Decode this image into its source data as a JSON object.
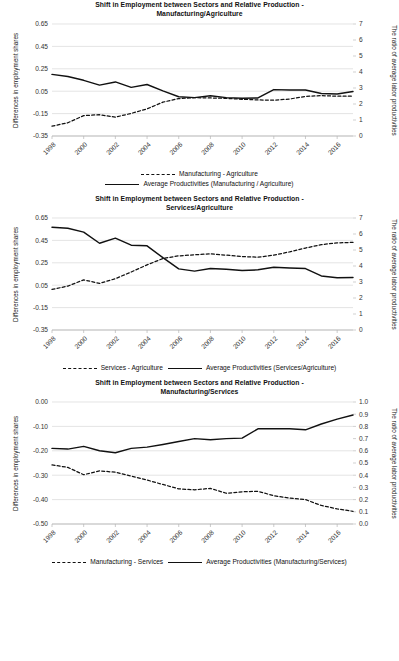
{
  "figure": {
    "axis_title_left": "Differences in employment shares",
    "axis_title_right": "The ratio of average labor productivities"
  },
  "chart_data": [
    {
      "type": "line",
      "title": "Shift in Employment between Sectors and Relative Production - Manufacturing/Agriculture",
      "title_line1": "Shift in Employment between Sectors and Relative Production -",
      "title_line2": "Manufacturing/Agriculture",
      "xlabel": "",
      "ylabel": "Differences in employment shares",
      "y2label": "The ratio of average labor productivities",
      "grid": true,
      "legend_position": "bottom",
      "legend_rows": 2,
      "x": [
        1998,
        1999,
        2000,
        2001,
        2002,
        2003,
        2004,
        2005,
        2006,
        2007,
        2008,
        2009,
        2010,
        2011,
        2012,
        2013,
        2014,
        2015,
        2016,
        2017
      ],
      "xticks": [
        1998,
        2000,
        2002,
        2004,
        2006,
        2008,
        2010,
        2012,
        2014,
        2016
      ],
      "ylim": [
        -0.35,
        0.65
      ],
      "yticks": [
        -0.35,
        -0.15,
        0.05,
        0.25,
        0.45,
        0.65
      ],
      "ytick_labels": [
        "-0.35",
        "-0.15",
        "0.05",
        "0.25",
        "0.45",
        "0.65"
      ],
      "y2lim": [
        0,
        7
      ],
      "y2ticks": [
        0,
        1,
        2,
        3,
        4,
        5,
        6,
        7
      ],
      "y2tick_labels": [
        "0",
        "1",
        "2",
        "3",
        "4",
        "5",
        "6",
        "7"
      ],
      "series": [
        {
          "name": "Manufacturing - Agriculture",
          "axis": "left",
          "style": "dashed",
          "values": [
            -0.262,
            -0.232,
            -0.168,
            -0.16,
            -0.182,
            -0.148,
            -0.108,
            -0.048,
            -0.016,
            -0.008,
            -0.01,
            -0.014,
            -0.022,
            -0.028,
            -0.03,
            -0.02,
            0.004,
            0.01,
            0.006,
            0.006
          ]
        },
        {
          "name": "Average Productivities (Manufacturing / Agriculture)",
          "axis": "right",
          "style": "solid",
          "values": [
            3.85,
            3.72,
            3.48,
            3.18,
            3.38,
            3.04,
            3.22,
            2.82,
            2.45,
            2.4,
            2.52,
            2.4,
            2.36,
            2.38,
            2.9,
            2.88,
            2.88,
            2.66,
            2.62,
            2.78
          ]
        }
      ]
    },
    {
      "type": "line",
      "title": "Shift in Employment between Sectors and Relative Production - Services/Agriculture",
      "title_line1": "Shift in Employment between Sectors and Relative Production -",
      "title_line2": "Services/Agriculture",
      "xlabel": "",
      "ylabel": "Differences in employment shares",
      "y2label": "The ratio of average labor productivities",
      "grid": true,
      "legend_position": "bottom",
      "legend_rows": 1,
      "x": [
        1998,
        1999,
        2000,
        2001,
        2002,
        2003,
        2004,
        2005,
        2006,
        2007,
        2008,
        2009,
        2010,
        2011,
        2012,
        2013,
        2014,
        2015,
        2016,
        2017
      ],
      "xticks": [
        1998,
        2000,
        2002,
        2004,
        2006,
        2008,
        2010,
        2012,
        2014,
        2016
      ],
      "ylim": [
        -0.35,
        0.65
      ],
      "yticks": [
        -0.35,
        -0.15,
        0.05,
        0.25,
        0.45,
        0.65
      ],
      "ytick_labels": [
        "-0.35",
        "-0.15",
        "0.05",
        "0.25",
        "0.45",
        "0.65"
      ],
      "y2lim": [
        0,
        7
      ],
      "y2ticks": [
        0,
        1,
        2,
        3,
        4,
        5,
        6,
        7
      ],
      "y2tick_labels": [
        "0",
        "1",
        "2",
        "3",
        "4",
        "5",
        "6",
        "7"
      ],
      "series": [
        {
          "name": "Services - Agriculture",
          "axis": "left",
          "style": "dashed",
          "values": [
            0.012,
            0.042,
            0.098,
            0.066,
            0.108,
            0.168,
            0.232,
            0.288,
            0.312,
            0.322,
            0.33,
            0.318,
            0.306,
            0.3,
            0.318,
            0.348,
            0.382,
            0.412,
            0.428,
            0.432
          ]
        },
        {
          "name": "Average Productivities (Services/Agriculture)",
          "axis": "right",
          "style": "solid",
          "values": [
            6.42,
            6.36,
            6.12,
            5.42,
            5.74,
            5.3,
            5.26,
            4.52,
            3.82,
            3.68,
            3.84,
            3.8,
            3.72,
            3.76,
            3.92,
            3.88,
            3.84,
            3.38,
            3.26,
            3.28
          ]
        }
      ]
    },
    {
      "type": "line",
      "title": "Shift in Employment between Sectors and Relative Production - Manufacturing/Services",
      "title_line1": "Shift in Employment between Sectors and Relative Production -",
      "title_line2": "Manufacturing/Services",
      "xlabel": "",
      "ylabel": "Differences in employment shares",
      "y2label": "The ratio of average labor productivities",
      "grid": true,
      "legend_position": "bottom",
      "legend_rows": 1,
      "x": [
        1998,
        1999,
        2000,
        2001,
        2002,
        2003,
        2004,
        2005,
        2006,
        2007,
        2008,
        2009,
        2010,
        2011,
        2012,
        2013,
        2014,
        2015,
        2016,
        2017
      ],
      "xticks": [
        1998,
        2000,
        2002,
        2004,
        2006,
        2008,
        2010,
        2012,
        2014,
        2016
      ],
      "ylim": [
        -0.5,
        0.0
      ],
      "yticks": [
        -0.5,
        -0.4,
        -0.3,
        -0.2,
        -0.1,
        0.0
      ],
      "ytick_labels": [
        "-0.50",
        "-0.40",
        "-0.30",
        "-0.20",
        "-0.10",
        "0.00"
      ],
      "y2lim": [
        0.0,
        1.0
      ],
      "y2ticks": [
        0.0,
        0.1,
        0.2,
        0.3,
        0.4,
        0.5,
        0.6,
        0.7,
        0.8,
        0.9,
        1.0
      ],
      "y2tick_labels": [
        "0.0",
        "0.1",
        "0.2",
        "0.3",
        "0.4",
        "0.5",
        "0.6",
        "0.7",
        "0.8",
        "0.9",
        "1.0"
      ],
      "series": [
        {
          "name": "Manufacturing - Services",
          "axis": "left",
          "style": "dashed",
          "values": [
            -0.258,
            -0.268,
            -0.298,
            -0.282,
            -0.288,
            -0.304,
            -0.32,
            -0.338,
            -0.356,
            -0.36,
            -0.354,
            -0.374,
            -0.368,
            -0.366,
            -0.384,
            -0.394,
            -0.4,
            -0.424,
            -0.438,
            -0.448
          ]
        },
        {
          "name": "Average Productivities (Manufacturing/Services)",
          "axis": "right",
          "style": "solid",
          "values": [
            0.62,
            0.614,
            0.636,
            0.6,
            0.584,
            0.62,
            0.63,
            0.652,
            0.676,
            0.7,
            0.69,
            0.7,
            0.704,
            0.78,
            0.78,
            0.78,
            0.772,
            0.82,
            0.86,
            0.894
          ]
        }
      ]
    }
  ]
}
